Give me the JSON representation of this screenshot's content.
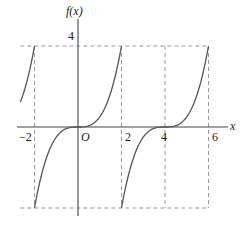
{
  "chart_data": {
    "type": "line",
    "title": "",
    "xlabel": "x",
    "ylabel": "f(x)",
    "origin_label": "O",
    "x_ticks": [
      {
        "value": -2,
        "label": "−2"
      },
      {
        "value": 2,
        "label": "2"
      },
      {
        "value": 4,
        "label": "4"
      },
      {
        "value": 6,
        "label": "6"
      }
    ],
    "y_ticks": [
      {
        "value": 4,
        "label": "4"
      }
    ],
    "xlim": [
      -2.8,
      6.9
    ],
    "ylim": [
      -4.4,
      5.8
    ],
    "grid": false,
    "legend": null,
    "dashed_guides": {
      "horizontal": [
        4,
        -4
      ],
      "vertical": [
        -2,
        2,
        4,
        6
      ],
      "x_span": [
        -2.65,
        6
      ]
    },
    "function": "f(x) = ((x - 4k)^3)/2 on [4k-2, 4k+2], periodic with period 4",
    "period": 4,
    "series": [
      {
        "name": "piece-left",
        "domain": [
          -2.65,
          -2
        ],
        "center": -4
      },
      {
        "name": "piece-center",
        "domain": [
          -2,
          2
        ],
        "center": 0
      },
      {
        "name": "piece-right",
        "domain": [
          2,
          6
        ],
        "center": 4
      }
    ],
    "key_points": [
      {
        "x": -2,
        "y": -4
      },
      {
        "x": -2,
        "y": 4
      },
      {
        "x": 0,
        "y": 0
      },
      {
        "x": 2,
        "y": -4
      },
      {
        "x": 2,
        "y": 4
      },
      {
        "x": 4,
        "y": 0
      },
      {
        "x": 6,
        "y": 4
      }
    ]
  },
  "colors": {
    "axis": "#444444",
    "curve": "#555555",
    "dash": "#999999",
    "text": "#222222"
  }
}
